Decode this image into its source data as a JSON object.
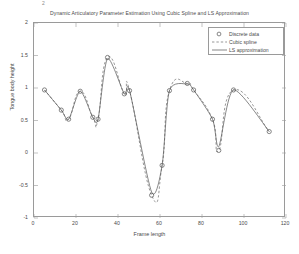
{
  "figure": {
    "title": "Dynamic Articulatory Parameter Estimation Using Cubic Spline and LS Approximation",
    "corner_mark": "2"
  },
  "legend": {
    "position": "top-right",
    "items": [
      {
        "label": "Discrete data",
        "style": "circle-marker",
        "icon": "circle-marker-icon"
      },
      {
        "label": "Cubic spline",
        "style": "dashed-line",
        "icon": "dashed-line-icon"
      },
      {
        "label": "LS approximation",
        "style": "solid-line",
        "icon": "solid-line-icon"
      }
    ]
  },
  "axes": {
    "xlabel": "Frame length",
    "ylabel": "Tongue body height",
    "xticks": [
      "0",
      "20",
      "40",
      "60",
      "80",
      "100",
      "120"
    ],
    "yticks": [
      "2",
      "1.5",
      "1",
      "0.5",
      "0",
      "-0.5",
      "-1"
    ]
  },
  "chart_data": {
    "type": "line",
    "title": "Dynamic Articulatory Parameter Estimation Using Cubic Spline and LS Approximation",
    "xlabel": "Frame length",
    "ylabel": "Tongue body height",
    "xlim": [
      0,
      120
    ],
    "ylim": [
      -1,
      2
    ],
    "xticks": [
      0,
      20,
      40,
      60,
      80,
      100,
      120
    ],
    "yticks": [
      -1,
      -0.5,
      0,
      0.5,
      1,
      1.5,
      2
    ],
    "grid": false,
    "legend_position": "upper right",
    "series": [
      {
        "name": "Discrete data",
        "type": "scatter",
        "marker": "circle",
        "color": "#555555",
        "x": [
          5,
          13,
          16.5,
          22,
          28,
          30.5,
          35,
          43,
          45.5,
          56,
          61,
          64.5,
          73,
          76,
          85,
          88,
          95,
          112
        ],
        "y": [
          0.97,
          0.66,
          0.52,
          0.95,
          0.55,
          0.52,
          1.47,
          0.91,
          0.96,
          -0.65,
          -0.19,
          0.96,
          1.07,
          0.97,
          0.52,
          0.04,
          0.97,
          0.33
        ]
      },
      {
        "name": "Cubic spline",
        "type": "line",
        "linestyle": "dashed",
        "color": "#6a6a6a",
        "x": [
          5,
          13,
          16.5,
          22,
          28,
          30.5,
          35,
          43,
          45.5,
          56,
          61,
          64.5,
          73,
          76,
          85,
          88,
          95,
          112
        ],
        "y": [
          0.97,
          0.66,
          0.52,
          0.95,
          0.55,
          0.52,
          1.47,
          0.91,
          0.96,
          -0.65,
          -0.19,
          0.96,
          1.07,
          0.97,
          0.52,
          0.04,
          0.97,
          0.33
        ]
      },
      {
        "name": "LS approximation",
        "type": "line",
        "linestyle": "solid",
        "color": "#555555",
        "x": [
          5,
          13,
          16.5,
          22,
          28,
          30.5,
          35,
          43,
          45.5,
          56,
          61,
          64.5,
          73,
          76,
          85,
          88,
          95,
          112
        ],
        "y": [
          0.97,
          0.66,
          0.52,
          0.95,
          0.55,
          0.52,
          1.45,
          0.91,
          0.96,
          -0.6,
          -0.19,
          0.96,
          1.06,
          0.97,
          0.52,
          0.1,
          0.97,
          0.33
        ]
      }
    ]
  }
}
